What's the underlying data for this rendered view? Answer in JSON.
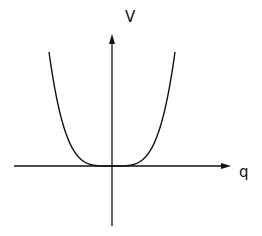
{
  "figure": {
    "y_axis_label": "V",
    "x_axis_label": "q",
    "line_color": "#111111",
    "background": "#ffffff"
  },
  "chart_data": {
    "type": "line",
    "title": "",
    "xlabel": "q",
    "ylabel": "V",
    "series": [
      {
        "name": "V(q)",
        "x": [
          -1.0,
          -0.8,
          -0.6,
          -0.4,
          -0.2,
          0.0,
          0.2,
          0.4,
          0.6,
          0.8,
          1.0
        ],
        "values": [
          1.0,
          0.41,
          0.13,
          0.026,
          0.0016,
          0.0,
          0.0016,
          0.026,
          0.13,
          0.41,
          1.0
        ]
      }
    ],
    "grid": false,
    "legend": "none",
    "ticks": "none"
  }
}
